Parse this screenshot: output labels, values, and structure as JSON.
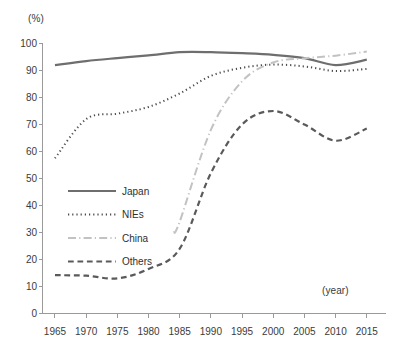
{
  "chart_data": {
    "type": "line",
    "title": "",
    "subtitle": "",
    "xlabel": "(year)",
    "ylabel": "(%)",
    "xlim": [
      1963,
      2018
    ],
    "ylim": [
      0,
      100
    ],
    "grid": false,
    "legend_position": "inside-left-lower",
    "x_ticks": [
      1965,
      1970,
      1975,
      1980,
      1985,
      1990,
      1995,
      2000,
      2005,
      2010,
      2015
    ],
    "y_ticks": [
      0,
      10,
      20,
      30,
      40,
      50,
      60,
      70,
      80,
      90,
      100
    ],
    "x_tick_labels": [
      "1965",
      "1970",
      "1975",
      "1980",
      "1985",
      "1990",
      "1995",
      "2000",
      "2005",
      "2010",
      "2015"
    ],
    "y_tick_labels": [
      "0",
      "10",
      "20",
      "30",
      "40",
      "50",
      "60",
      "70",
      "80",
      "90",
      "100"
    ],
    "series": [
      {
        "name": "Japan",
        "style": "solid",
        "color": "#6e6e6e",
        "width": 2.2,
        "x": [
          1965,
          1970,
          1975,
          1980,
          1985,
          1990,
          1995,
          2000,
          2005,
          2010,
          2015
        ],
        "values": [
          92.0,
          93.5,
          94.6,
          95.6,
          96.8,
          96.8,
          96.4,
          95.8,
          94.6,
          92.0,
          94.0
        ]
      },
      {
        "name": "NIEs",
        "style": "dotted",
        "color": "#4a4a4a",
        "width": 2.0,
        "x": [
          1965,
          1970,
          1975,
          1980,
          1985,
          1990,
          1995,
          2000,
          2005,
          2010,
          2015
        ],
        "values": [
          57.5,
          72.0,
          74.0,
          76.5,
          81.5,
          88.0,
          91.0,
          92.2,
          91.5,
          89.8,
          90.6
        ]
      },
      {
        "name": "China",
        "style": "dash-dot",
        "color": "#c2c2c2",
        "width": 2.0,
        "x": [
          1984,
          1985,
          1990,
          1995,
          2000,
          2005,
          2010,
          2015
        ],
        "values": [
          30.0,
          34.0,
          68.0,
          86.0,
          93.0,
          94.5,
          95.5,
          97.0
        ]
      },
      {
        "name": "Others",
        "style": "dashed",
        "color": "#5a5a5a",
        "width": 2.2,
        "x": [
          1965,
          1970,
          1975,
          1980,
          1985,
          1990,
          1995,
          2000,
          2005,
          2010,
          2015
        ],
        "values": [
          14.2,
          14.0,
          13.0,
          16.5,
          24.0,
          52.0,
          70.0,
          75.0,
          70.0,
          64.0,
          68.5
        ]
      }
    ]
  },
  "legend": {
    "items": [
      {
        "label": "Japan"
      },
      {
        "label": "NIEs"
      },
      {
        "label": "China"
      },
      {
        "label": "Others"
      }
    ]
  }
}
